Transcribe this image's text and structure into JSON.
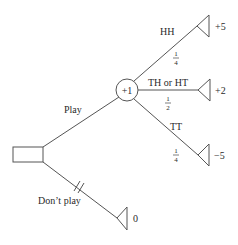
{
  "diagram": {
    "type": "decision-tree",
    "decision_node": {
      "shape": "rectangle"
    },
    "chance_node": {
      "label": "+1"
    },
    "branches": {
      "play": {
        "label": "Play"
      },
      "dont_play": {
        "label": "Don’t play",
        "payoff": "0",
        "blocked_marker": "//"
      }
    },
    "outcomes": [
      {
        "label": "HH",
        "probability": {
          "num": "1",
          "den": "4"
        },
        "payoff": "+5"
      },
      {
        "label": "TH or HT",
        "probability": {
          "num": "1",
          "den": "2"
        },
        "payoff": "+2"
      },
      {
        "label": "TT",
        "probability": {
          "num": "1",
          "den": "4"
        },
        "payoff": "−5"
      }
    ]
  }
}
